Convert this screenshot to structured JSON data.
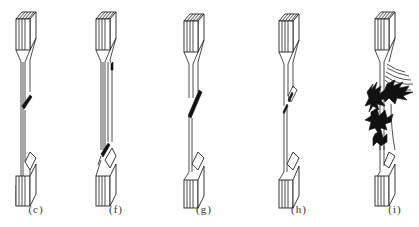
{
  "figure": {
    "type": "tensile specimen failure modes",
    "panels": [
      {
        "id": "c",
        "label": "(c)",
        "failure": "angled fracture in gauge section",
        "left": 6
      },
      {
        "id": "f",
        "label": "(f)",
        "failure": "long longitudinal split with fracture near lower tab",
        "left": 86
      },
      {
        "id": "g",
        "label": "(g)",
        "failure": "angled fracture in gauge section",
        "left": 174
      },
      {
        "id": "h",
        "label": "(h)",
        "failure": "stepped fracture with delamination in gauge section",
        "left": 269
      },
      {
        "id": "i",
        "label": "(i)",
        "failure": "explosive splintering / brooming in gauge section",
        "left": 365
      }
    ]
  },
  "colors": {
    "line": "#222222",
    "damage": "#111111",
    "background": "#ffffff",
    "label": "#333333"
  }
}
